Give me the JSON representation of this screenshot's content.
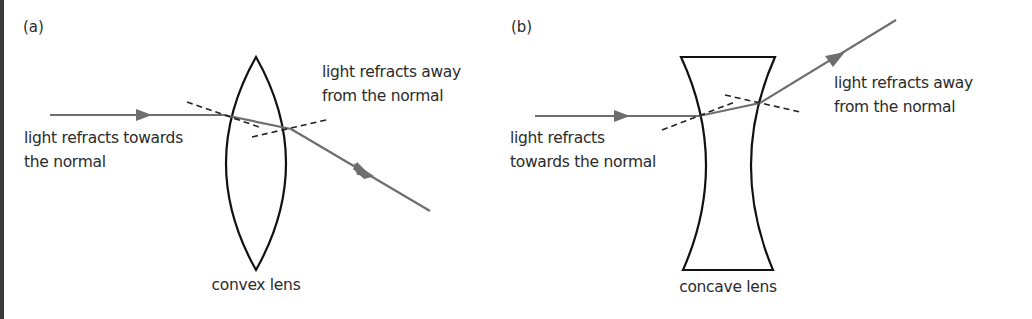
{
  "colors": {
    "lens_stroke": "#111111",
    "ray": "#6e6e6e",
    "normal_dash": "#222222",
    "text": "#2b2b2b",
    "left_border": "#3a3a3a"
  },
  "panel_a": {
    "tag": "(a)",
    "lens_name": "convex lens",
    "label_in_line1": "light refracts towards",
    "label_in_line2": "the normal",
    "label_out_line1": "light refracts away",
    "label_out_line2": "from the normal"
  },
  "panel_b": {
    "tag": "(b)",
    "lens_name": "concave lens",
    "label_in_line1": "light refracts",
    "label_in_line2": "towards the normal",
    "label_out_line1": "light refracts away",
    "label_out_line2": "from the normal"
  }
}
